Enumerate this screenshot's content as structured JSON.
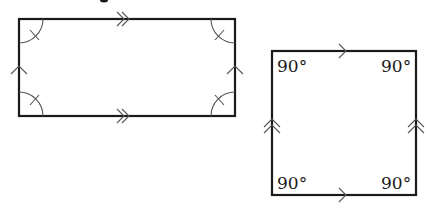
{
  "diagram": {
    "rectangle": {
      "corners": {
        "x1": 19,
        "y1": 19,
        "x2": 235,
        "y2": 116
      },
      "parallel_marks": {
        "horizontal": "double-arrow",
        "vertical": "single-arrow"
      },
      "angle_marks": "arc-with-tick"
    },
    "square": {
      "corners": {
        "x1": 272,
        "y1": 51,
        "x2": 416,
        "y2": 195
      },
      "parallel_marks": {
        "horizontal": "single-arrow",
        "vertical": "double-arrow"
      },
      "angle_labels": {
        "top_left": "90°",
        "top_right": "90°",
        "bottom_left": "90°",
        "bottom_right": "90°"
      }
    },
    "colors": {
      "stroke": "#1a1a1a",
      "marks": "#555555",
      "background": "#ffffff"
    }
  }
}
